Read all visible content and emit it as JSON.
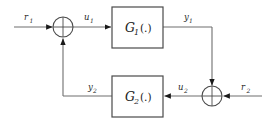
{
  "diagram": {
    "type": "control-block-diagram",
    "colors": {
      "background": "#ffffff",
      "line": "#6e6e6e",
      "block_border": "#4a4a4a",
      "text": "#1a1a1a",
      "arrow": "#1a1a1a"
    },
    "blocks": [
      {
        "id": "g1",
        "symbol": "G",
        "subscript": "1",
        "argument": "(.)",
        "full_label": "G1 (.)",
        "x": 112,
        "y": 7,
        "width": 51,
        "height": 41
      },
      {
        "id": "g2",
        "symbol": "G",
        "subscript": "2",
        "argument": "(.)",
        "full_label": "G2 (.)",
        "x": 112,
        "y": 76,
        "width": 51,
        "height": 41
      }
    ],
    "summing_junctions": [
      {
        "id": "sum-left",
        "cx": 63,
        "cy": 27,
        "r": 10,
        "style": "cross",
        "inputs": [
          "r1",
          "y2"
        ],
        "output": "u1"
      },
      {
        "id": "sum-right",
        "cx": 212,
        "cy": 96,
        "r": 10,
        "style": "cross",
        "inputs": [
          "y1",
          "r2"
        ],
        "output": "u2"
      }
    ],
    "signals": [
      {
        "id": "r1",
        "symbol": "r",
        "subscript": "1",
        "label": "r1",
        "lx": 24,
        "ly": 16
      },
      {
        "id": "u1",
        "symbol": "u",
        "subscript": "1",
        "label": "u1",
        "lx": 84,
        "ly": 16
      },
      {
        "id": "y1",
        "symbol": "y",
        "subscript": "1",
        "label": "y1",
        "lx": 184,
        "ly": 16
      },
      {
        "id": "u2",
        "symbol": "u",
        "subscript": "2",
        "label": "u2",
        "lx": 181,
        "ly": 86
      },
      {
        "id": "r2",
        "symbol": "r",
        "subscript": "2",
        "label": "r2",
        "lx": 243,
        "ly": 86
      },
      {
        "id": "y2",
        "symbol": "y",
        "subscript": "2",
        "label": "y2",
        "lx": 91,
        "ly": 86
      }
    ],
    "connections": [
      {
        "from": "r1-source",
        "to": "sum-left",
        "path": "horizontal",
        "arrow": true
      },
      {
        "from": "sum-left",
        "to": "g1",
        "path": "horizontal",
        "arrow": true
      },
      {
        "from": "g1",
        "to": "sum-right",
        "path": "right-then-down",
        "arrow": true
      },
      {
        "from": "r2-source",
        "to": "sum-right",
        "path": "horizontal-left",
        "arrow": true
      },
      {
        "from": "sum-right",
        "to": "g2",
        "path": "horizontal-left",
        "arrow": true
      },
      {
        "from": "g2",
        "to": "sum-left",
        "path": "left-then-up",
        "arrow": true
      }
    ]
  }
}
